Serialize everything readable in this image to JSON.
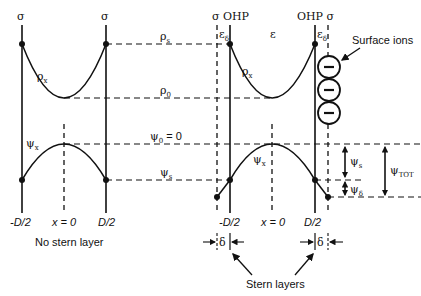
{
  "diagram": {
    "left_panel": {
      "caption": "No stern layer",
      "top_labels": [
        "σ",
        "σ"
      ],
      "curve_labels": {
        "charge_density": "ρ",
        "charge_density_sub": "x",
        "potential": "ψ",
        "potential_sub": "x"
      },
      "axis_labels": {
        "left": "-D/2",
        "center": "x = 0",
        "right": "D/2"
      }
    },
    "right_panel": {
      "top_left_label": "σ OHP",
      "top_right_label": "OHP σ",
      "epsilon_left": "ε",
      "epsilon_left_sub": "δ",
      "epsilon_center": "ε",
      "epsilon_right": "ε",
      "epsilon_right_sub": "δ",
      "curve_labels": {
        "charge_density": "ρ",
        "charge_density_sub": "x",
        "potential": "ψ",
        "potential_sub": "x"
      },
      "axis_labels": {
        "left": "-D/2",
        "center": "x = 0",
        "right": "D/2"
      },
      "delta_label": "δ",
      "caption": "Stern layers",
      "surface_ions_label": "Surface ions",
      "ion_symbol": "−",
      "ion_count": 3
    },
    "levels": {
      "rho_s": {
        "sym": "ρ",
        "sub": "s"
      },
      "rho_0": {
        "sym": "ρ",
        "sub": "0"
      },
      "psi_0": {
        "sym": "ψ",
        "sub": "0",
        "suffix": " = 0"
      },
      "psi_s": {
        "sym": "ψ",
        "sub": "s"
      }
    },
    "potential_drops": {
      "psi_s": {
        "sym": "ψ",
        "sub": "s"
      },
      "psi_delta": {
        "sym": "ψ",
        "sub": "δ"
      },
      "psi_tot": {
        "sym": "ψ",
        "sub": "TOT"
      }
    }
  }
}
